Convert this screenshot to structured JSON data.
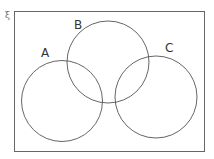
{
  "universal_symbol": "ξ",
  "sets": [
    {
      "label": "A"
    },
    {
      "label": "B"
    },
    {
      "label": "C"
    }
  ],
  "colors": {
    "stroke": "#555555",
    "background": "#ffffff"
  }
}
